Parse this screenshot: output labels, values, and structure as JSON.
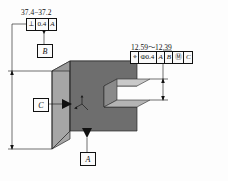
{
  "drawing": {
    "title": "isometric-slotted-block-gdt",
    "background": "#fdfdfd",
    "line_color": "#111111"
  },
  "solid": {
    "name": "c-shaped-block",
    "top_face_color": "#9a9a9a",
    "front_face_color": "#6e6e6e",
    "left_face_color": "#a6a6a6",
    "slot_top_color": "#c9c9c9",
    "slot_back_color": "#8a8a8a",
    "edge_color": "#2a2a2a"
  },
  "annotations": {
    "height_dimension": {
      "label": "37.4−37.2",
      "name": "overall-height-dimension"
    },
    "perpendicularity_frame": {
      "symbol": "⟂",
      "tolerance": "0.4",
      "datum": "A",
      "name": "perpendicularity-feature-control-frame"
    },
    "slot_dimension": {
      "label": "12.59～12.39",
      "name": "slot-width-dimension"
    },
    "position_frame": {
      "symbol": "⌖",
      "tolerance": "Φ0.4",
      "datum_primary": "A",
      "datum_secondary": "B",
      "modifier": "Ⓜ",
      "datum_tertiary": "C",
      "name": "position-feature-control-frame"
    },
    "datum_a": {
      "label": "A",
      "name": "datum-feature-a"
    },
    "datum_b": {
      "label": "B",
      "name": "datum-feature-b"
    },
    "datum_c": {
      "label": "C",
      "name": "datum-feature-c"
    }
  }
}
